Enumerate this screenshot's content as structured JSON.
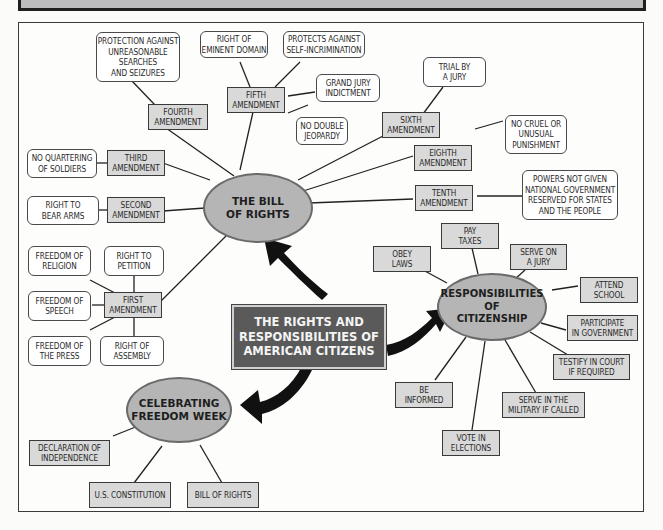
{
  "header": {
    "title_visible": false
  },
  "center": {
    "label": "THE RIGHTS AND\nRESPONSIBILITIES OF\nAMERICAN CITIZENS"
  },
  "bill_of_rights": {
    "label": "THE BILL\nOF RIGHTS",
    "amendments": {
      "first": {
        "label": "FIRST\nAMENDMENT",
        "details": [
          "FREEDOM OF\nRELIGION",
          "RIGHT TO\nPETITION",
          "FREEDOM OF\nSPEECH",
          "FREEDOM OF\nTHE PRESS",
          "RIGHT OF\nASSEMBLY"
        ]
      },
      "second": {
        "label": "SECOND\nAMENDMENT",
        "details": [
          "RIGHT TO\nBEAR ARMS"
        ]
      },
      "third": {
        "label": "THIRD\nAMENDMENT",
        "details": [
          "NO QUARTERING\nOF SOLDIERS"
        ]
      },
      "fourth": {
        "label": "FOURTH\nAMENDMENT",
        "details": [
          "PROTECTION AGAINST\nUNREASONABLE\nSEARCHES\nAND SEIZURES"
        ]
      },
      "fifth": {
        "label": "FIFTH\nAMENDMENT",
        "details": [
          "RIGHT OF\nEMINENT DOMAIN",
          "PROTECTS AGAINST\nSELF-INCRIMINATION",
          "GRAND JURY\nINDICTMENT",
          "NO DOUBLE\nJEOPARDY"
        ]
      },
      "sixth": {
        "label": "SIXTH\nAMENDMENT",
        "details": [
          "TRIAL BY\nA JURY"
        ]
      },
      "eighth": {
        "label": "EIGHTH\nAMENDMENT",
        "details": [
          "NO CRUEL OR\nUNUSUAL\nPUNISHMENT"
        ]
      },
      "tenth": {
        "label": "TENTH\nAMENDMENT",
        "details": [
          "POWERS NOT GIVEN\nNATIONAL GOVERNMENT\nRESERVED FOR STATES\nAND THE PEOPLE"
        ]
      }
    }
  },
  "responsibilities": {
    "label": "RESPONSIBILITIES\nOF\nCITIZENSHIP",
    "items": [
      "OBEY\nLAWS",
      "PAY\nTAXES",
      "SERVE ON\nA JURY",
      "ATTEND\nSCHOOL",
      "PARTICIPATE\nIN GOVERNMENT",
      "TESTIFY IN COURT\nIF REQUIRED",
      "SERVE IN THE\nMILITARY IF CALLED",
      "VOTE IN\nELECTIONS",
      "BE\nINFORMED"
    ]
  },
  "freedom_week": {
    "label": "CELEBRATING\nFREEDOM WEEK",
    "items": [
      "DECLARATION OF\nINDEPENDENCE",
      "U.S. CONSTITUTION",
      "BILL OF RIGHTS"
    ]
  },
  "colors": {
    "ellipse_fill": "#b5b5b5",
    "box_fill": "#d9d9d9",
    "center_fill": "#5a5a5a",
    "line": "#222222"
  }
}
